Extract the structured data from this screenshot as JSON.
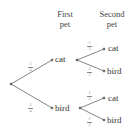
{
  "headers": {
    "first": [
      "First",
      "pet"
    ],
    "second": [
      "Second",
      "pet"
    ]
  },
  "nodes": {
    "first_cat": "cat",
    "first_bird": "bird",
    "second_cat_cat": "cat",
    "second_cat_bird": "bird",
    "second_bird_cat": "cat",
    "second_bird_bird": "bird"
  },
  "probabilities": {
    "first_cat": {
      "num": "1",
      "den": "4"
    },
    "first_bird": {
      "num": "3",
      "den": "4"
    },
    "cat_cat": {
      "num": "1",
      "den": "3"
    },
    "cat_bird": {
      "num": "2",
      "den": "3"
    },
    "bird_cat": {
      "num": "1",
      "den": "3"
    },
    "bird_bird": {
      "num": "2",
      "den": "3"
    }
  },
  "colors": {
    "line": "#666666",
    "text": "#333333"
  }
}
